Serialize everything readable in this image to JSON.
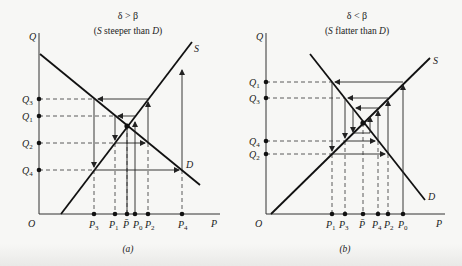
{
  "figure": {
    "panels": [
      {
        "id": "a",
        "title": "δ > β",
        "subtitle_open": "(",
        "subtitle_s": "S",
        "subtitle_mid": " steeper than ",
        "subtitle_d": "D",
        "subtitle_close": ")",
        "caption": "(a)",
        "axis_y_label": "Q",
        "axis_x_label": "P",
        "origin_label": "O",
        "supply_label": "S",
        "demand_label": "D",
        "q_labels": [
          {
            "main": "Q",
            "sub": "3"
          },
          {
            "main": "Q",
            "sub": "1"
          },
          {
            "main": "Q",
            "sub": "2"
          },
          {
            "main": "Q",
            "sub": "4"
          }
        ],
        "p_labels": [
          {
            "main": "P",
            "sub": "3"
          },
          {
            "main": "P",
            "sub": "1"
          },
          {
            "main": "P̄",
            "sub": ""
          },
          {
            "main": "P",
            "sub": "0"
          },
          {
            "main": "P",
            "sub": "2"
          },
          {
            "main": "P",
            "sub": "4"
          }
        ]
      },
      {
        "id": "b",
        "title": "δ < β",
        "subtitle_open": "(",
        "subtitle_s": "S",
        "subtitle_mid": " flatter than ",
        "subtitle_d": "D",
        "subtitle_close": ")",
        "caption": "(b)",
        "axis_y_label": "Q",
        "axis_x_label": "P",
        "origin_label": "O",
        "supply_label": "S",
        "demand_label": "D",
        "q_labels": [
          {
            "main": "Q",
            "sub": "1"
          },
          {
            "main": "Q",
            "sub": "3"
          },
          {
            "main": "Q",
            "sub": "4"
          },
          {
            "main": "Q",
            "sub": "2"
          }
        ],
        "p_labels": [
          {
            "main": "P",
            "sub": "1"
          },
          {
            "main": "P",
            "sub": "3"
          },
          {
            "main": "P̄",
            "sub": ""
          },
          {
            "main": "P",
            "sub": "4"
          },
          {
            "main": "P",
            "sub": "2"
          },
          {
            "main": "P",
            "sub": "0"
          }
        ]
      }
    ]
  }
}
